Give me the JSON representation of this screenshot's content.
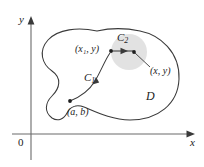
{
  "figure": {
    "type": "vector-field-path-independence-diagram",
    "axes": {
      "y_label": "y",
      "x_label": "x",
      "origin_label": "0"
    },
    "region": {
      "label": "D"
    },
    "curves": [
      {
        "name": "curve-1",
        "label": "C",
        "subscript": "1"
      },
      {
        "name": "curve-2",
        "label": "C",
        "subscript": "2"
      }
    ],
    "points": [
      {
        "name": "start-point",
        "label": "(a, b)"
      },
      {
        "name": "intermediate-point",
        "label": "(x₁, y)"
      },
      {
        "name": "end-point",
        "label": "(x, y)"
      }
    ],
    "colors": {
      "stroke": "#3a3a3a",
      "disk_fill": "#e2e2e2",
      "text": "#222222",
      "background": "#ffffff"
    }
  }
}
